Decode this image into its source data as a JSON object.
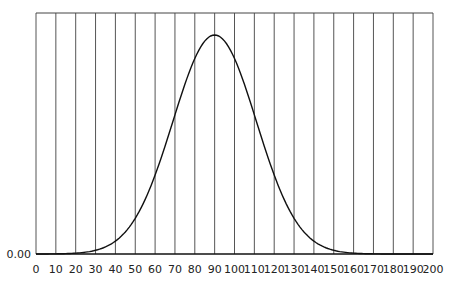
{
  "chart_data": {
    "type": "line",
    "title": "",
    "xlabel": "",
    "ylabel": "",
    "xlim": [
      0,
      200
    ],
    "ylim": [
      0.0,
      0.0205
    ],
    "x_ticks": [
      0,
      10,
      20,
      30,
      40,
      50,
      60,
      70,
      80,
      90,
      100,
      110,
      120,
      130,
      140,
      150,
      160,
      170,
      180,
      190,
      200
    ],
    "y_ticks": [
      "0.00"
    ],
    "grid": {
      "vertical": true,
      "horizontal": false
    },
    "legend": null,
    "series": [
      {
        "name": "density",
        "distribution": "normal",
        "mean": 90,
        "sd": 21,
        "x": [
          0,
          10,
          20,
          30,
          40,
          50,
          60,
          70,
          80,
          90,
          100,
          110,
          120,
          130,
          140,
          150,
          160,
          170,
          180,
          190,
          200
        ],
        "values": [
          0.0,
          0.0001,
          0.0007,
          0.0032,
          0.0112,
          0.0305,
          0.0687,
          0.1211,
          0.1693,
          0.19,
          0.1693,
          0.1211,
          0.0687,
          0.0305,
          0.0112,
          0.0032,
          0.0007,
          0.0001,
          0.0,
          0.0,
          0.0
        ]
      }
    ],
    "colors": {
      "line": "#111111",
      "grid": "#555555",
      "frame": "#444444"
    }
  }
}
